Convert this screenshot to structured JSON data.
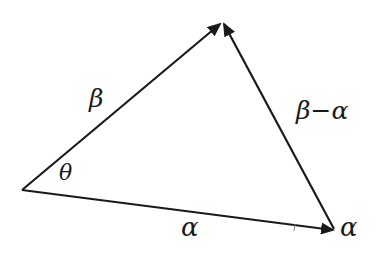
{
  "diagram": {
    "type": "vector-triangle",
    "stroke_color": "#1a1a1a",
    "background": "#ffffff",
    "vertices": {
      "origin": [
        22,
        190
      ],
      "apex": [
        222,
        22
      ],
      "right": [
        333,
        230
      ]
    },
    "edges": [
      {
        "id": "beta",
        "from": "origin",
        "to": "apex",
        "arrow": true,
        "label": "β"
      },
      {
        "id": "alpha",
        "from": "origin",
        "to": "right",
        "arrow": true,
        "label": "α"
      },
      {
        "id": "beta-minus-alpha",
        "from": "right",
        "to": "apex",
        "arrow": true,
        "label": "β−α"
      }
    ],
    "labels": {
      "beta": "β",
      "theta": "θ",
      "alpha_bottom": "α",
      "alpha_right": "α",
      "beta_minus_alpha": "β−α"
    }
  }
}
